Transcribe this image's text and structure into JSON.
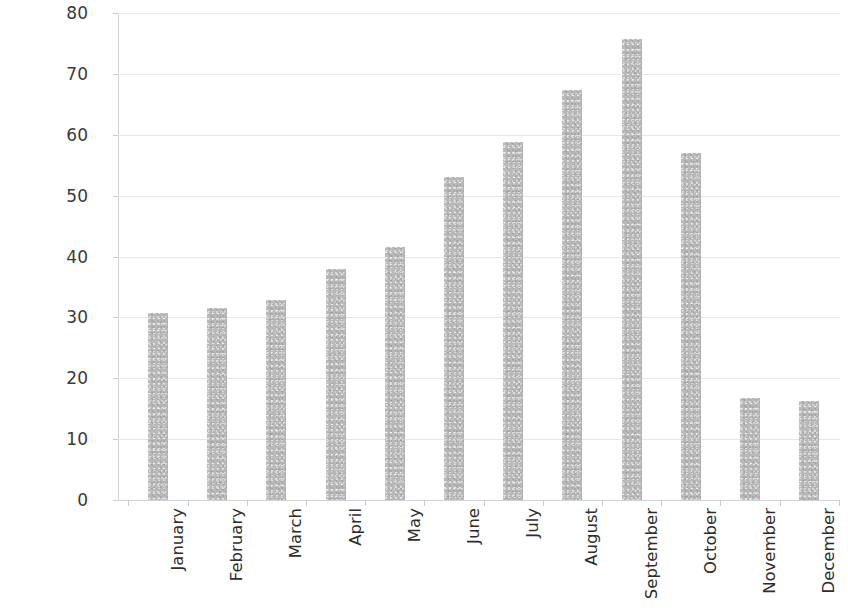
{
  "chart_data": {
    "type": "bar",
    "title": "",
    "subtitle": "",
    "xlabel": "",
    "ylabel": "Percentage of Households",
    "categories": [
      "January",
      "February",
      "March",
      "April",
      "May",
      "June",
      "July",
      "August",
      "September",
      "October",
      "November",
      "December"
    ],
    "values": [
      30.8,
      31.5,
      32.8,
      38.0,
      41.5,
      53.0,
      58.8,
      67.3,
      75.7,
      57.0,
      16.8,
      16.2
    ],
    "ylim": [
      0,
      80
    ],
    "ytick_labels": [
      "80",
      "70",
      "60",
      "50",
      "40",
      "30",
      "20",
      "10",
      "0"
    ],
    "ytick_values": [
      80,
      70,
      60,
      50,
      40,
      30,
      20,
      10,
      0
    ],
    "grid": true,
    "grid_axis": "y",
    "legend": false,
    "legend_position": "none",
    "bar_color": "#b9b9b9",
    "grid_color": "#e3e6ea",
    "axis_color": "#d2d6da",
    "text_color": "#2e2e2e",
    "background_color": "#ffffff",
    "xtick_label_rotation": 90
  }
}
